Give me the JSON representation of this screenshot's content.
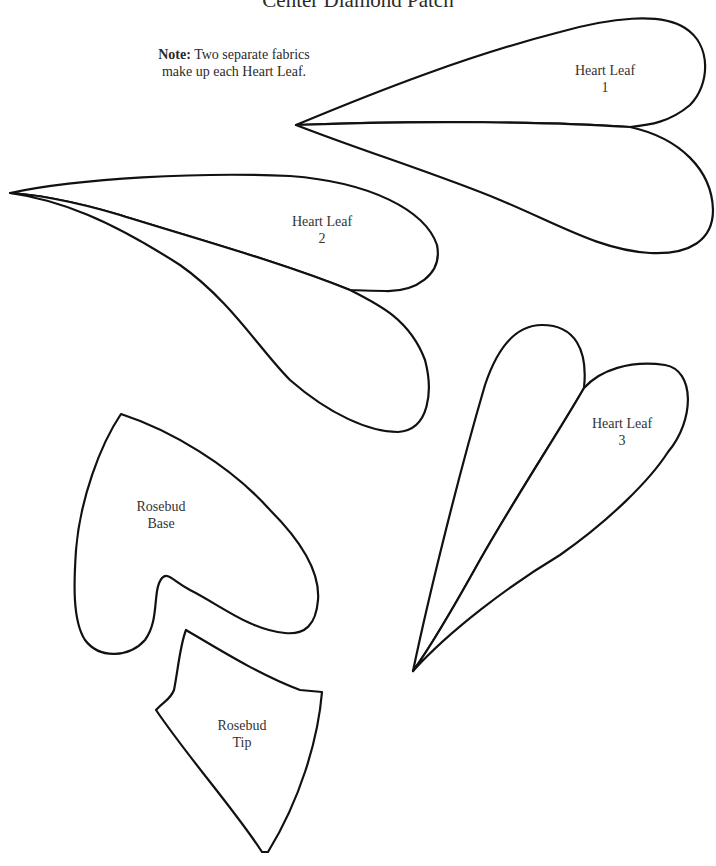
{
  "title": "Center Diamond Patch",
  "note": {
    "prefix": "Note:",
    "line1": "Two separate fabrics",
    "line2": "make up each Heart Leaf."
  },
  "pieces": [
    {
      "id": "heart-leaf-1",
      "line1": "Heart Leaf",
      "line2": "1"
    },
    {
      "id": "heart-leaf-2",
      "line1": "Heart Leaf",
      "line2": "2"
    },
    {
      "id": "heart-leaf-3",
      "line1": "Heart Leaf",
      "line2": "3"
    },
    {
      "id": "rosebud-base",
      "line1": "Rosebud",
      "line2": "Base"
    },
    {
      "id": "rosebud-tip",
      "line1": "Rosebud",
      "line2": "Tip"
    }
  ],
  "colors": {
    "outline": "#111111",
    "background": "#ffffff"
  }
}
